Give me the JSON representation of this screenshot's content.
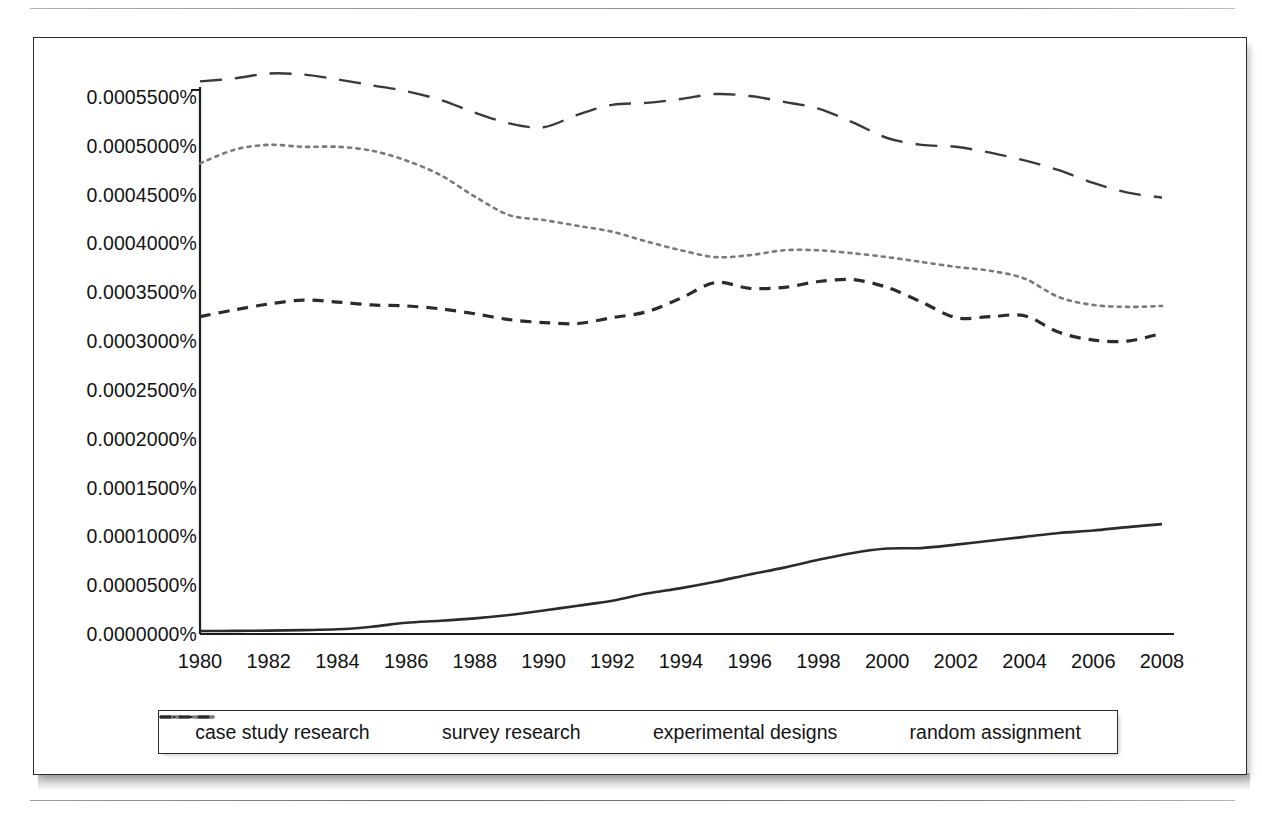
{
  "figure": {
    "type": "line-chart",
    "background": "#ffffff",
    "frame_color": "#2a2a2a"
  },
  "chart_data": {
    "type": "line",
    "title": "",
    "subtitle": "",
    "xlabel": "",
    "ylabel": "",
    "grid": false,
    "legend_position": "bottom",
    "xlim": [
      1980,
      2008
    ],
    "ylim": [
      0.0,
      0.00055
    ],
    "x_tick_labels": [
      "1980",
      "1982",
      "1984",
      "1986",
      "1988",
      "1990",
      "1992",
      "1994",
      "1996",
      "1998",
      "2000",
      "2002",
      "2004",
      "2006",
      "2008"
    ],
    "x_ticks": [
      1980,
      1982,
      1984,
      1986,
      1988,
      1990,
      1992,
      1994,
      1996,
      1998,
      2000,
      2002,
      2004,
      2006,
      2008
    ],
    "y_tick_labels": [
      "0.0005500%",
      "0.0005000%",
      "0.0004500%",
      "0.0004000%",
      "0.0003500%",
      "0.0003000%",
      "0.0002500%",
      "0.0002000%",
      "0.0001500%",
      "0.0001000%",
      "0.0000500%",
      "0.0000000%"
    ],
    "y_ticks": [
      0.00055,
      0.0005,
      0.00045,
      0.0004,
      0.00035,
      0.0003,
      0.00025,
      0.0002,
      0.00015,
      0.0001,
      5e-05,
      0.0
    ],
    "y_unit": "%",
    "x": [
      1980,
      1981,
      1982,
      1983,
      1984,
      1985,
      1986,
      1987,
      1988,
      1989,
      1990,
      1991,
      1992,
      1993,
      1994,
      1995,
      1996,
      1997,
      1998,
      1999,
      2000,
      2001,
      2002,
      2003,
      2004,
      2005,
      2006,
      2007,
      2008
    ],
    "series": [
      {
        "name": "case study research",
        "line_style": "solid",
        "color": "#2b2b2b",
        "width": 2.6,
        "values": [
          3e-06,
          3.2e-06,
          3.5e-06,
          4e-06,
          4.8e-06,
          7.5e-06,
          1.15e-05,
          1.35e-05,
          1.6e-05,
          1.95e-05,
          2.4e-05,
          2.9e-05,
          3.4e-05,
          4.15e-05,
          4.7e-05,
          5.35e-05,
          6.1e-05,
          6.8e-05,
          7.6e-05,
          8.3e-05,
          8.75e-05,
          8.8e-05,
          9.15e-05,
          9.55e-05,
          9.95e-05,
          0.0001035,
          0.000106,
          0.0001095,
          0.0001125
        ]
      },
      {
        "name": "survey research",
        "line_style": "long-dash",
        "color": "#3a3a3a",
        "width": 2.4,
        "values": [
          0.000566,
          0.000569,
          0.000574,
          0.000573,
          0.000568,
          0.000562,
          0.000556,
          0.000547,
          0.000534,
          0.000523,
          0.000519,
          0.000532,
          0.000542,
          0.000544,
          0.000548,
          0.000553,
          0.000551,
          0.000545,
          0.000538,
          0.000524,
          0.000508,
          0.000501,
          0.000499,
          0.000493,
          0.000485,
          0.000475,
          0.000462,
          0.000452,
          0.000447
        ]
      },
      {
        "name": "experimental designs",
        "line_style": "dotted",
        "color": "#7a7a7a",
        "width": 2.6,
        "values": [
          0.000482,
          0.000496,
          0.000501,
          0.000499,
          0.000499,
          0.000495,
          0.000485,
          0.00047,
          0.000448,
          0.000429,
          0.000424,
          0.000418,
          0.000412,
          0.000402,
          0.000393,
          0.000386,
          0.000388,
          0.000393,
          0.000393,
          0.00039,
          0.000386,
          0.000381,
          0.000376,
          0.000372,
          0.000364,
          0.000345,
          0.000337,
          0.000335,
          0.000336
        ]
      },
      {
        "name": "random assignment",
        "line_style": "short-dash",
        "color": "#2b2b2b",
        "width": 3.2,
        "values": [
          0.000325,
          0.000332,
          0.000338,
          0.000342,
          0.00034,
          0.000337,
          0.000336,
          0.000333,
          0.000328,
          0.000322,
          0.000319,
          0.000318,
          0.000324,
          0.00033,
          0.000344,
          0.00036,
          0.000354,
          0.000355,
          0.000361,
          0.000363,
          0.000355,
          0.00034,
          0.000324,
          0.000325,
          0.000326,
          0.000309,
          0.000301,
          0.0003,
          0.000308
        ]
      }
    ]
  },
  "legend": {
    "items": [
      {
        "label": "case study research",
        "style": "solid"
      },
      {
        "label": "survey research",
        "style": "long-dash"
      },
      {
        "label": "experimental designs",
        "style": "dotted"
      },
      {
        "label": "random assignment",
        "style": "short-dash"
      }
    ]
  }
}
